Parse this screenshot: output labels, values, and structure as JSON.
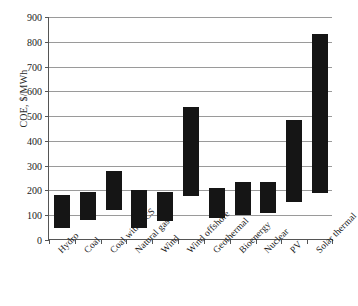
{
  "chart_data": {
    "type": "bar",
    "bar_style": "floating-range",
    "title": "",
    "xlabel": "",
    "ylabel": "COE, $/MWh",
    "ylim": [
      0,
      900
    ],
    "ytick_step": 100,
    "yticks": [
      0,
      100,
      200,
      300,
      400,
      500,
      600,
      700,
      800,
      900
    ],
    "ytick_labels": [
      "0",
      "100",
      "200",
      "300",
      "400",
      "500",
      "600",
      "700",
      "800",
      "900"
    ],
    "grid": true,
    "grid_axis": "y",
    "legend": false,
    "legend_position": "none",
    "bar_color": "#151515",
    "categories": [
      "Hydro",
      "Coal",
      "Coal with CCS",
      "Natural gas",
      "Wind",
      "Wind offshore",
      "Geothermal",
      "Bioenergy",
      "Nuclear",
      "PV",
      "Solar thermal"
    ],
    "series": [
      {
        "name": "COE low",
        "values": [
          50,
          82,
          122,
          50,
          75,
          178,
          88,
          100,
          110,
          155,
          188
        ]
      },
      {
        "name": "COE high",
        "values": [
          180,
          195,
          280,
          202,
          195,
          538,
          208,
          235,
          235,
          483,
          832
        ]
      }
    ],
    "ranges": [
      {
        "category": "Hydro",
        "low": 50,
        "high": 180
      },
      {
        "category": "Coal",
        "low": 82,
        "high": 195
      },
      {
        "category": "Coal with CCS",
        "low": 122,
        "high": 280
      },
      {
        "category": "Natural gas",
        "low": 50,
        "high": 202
      },
      {
        "category": "Wind",
        "low": 75,
        "high": 195
      },
      {
        "category": "Wind offshore",
        "low": 178,
        "high": 538
      },
      {
        "category": "Geothermal",
        "low": 88,
        "high": 208
      },
      {
        "category": "Bioenergy",
        "low": 100,
        "high": 235
      },
      {
        "category": "Nuclear",
        "low": 110,
        "high": 235
      },
      {
        "category": "PV",
        "low": 155,
        "high": 483
      },
      {
        "category": "Solar thermal",
        "low": 188,
        "high": 832
      }
    ]
  }
}
